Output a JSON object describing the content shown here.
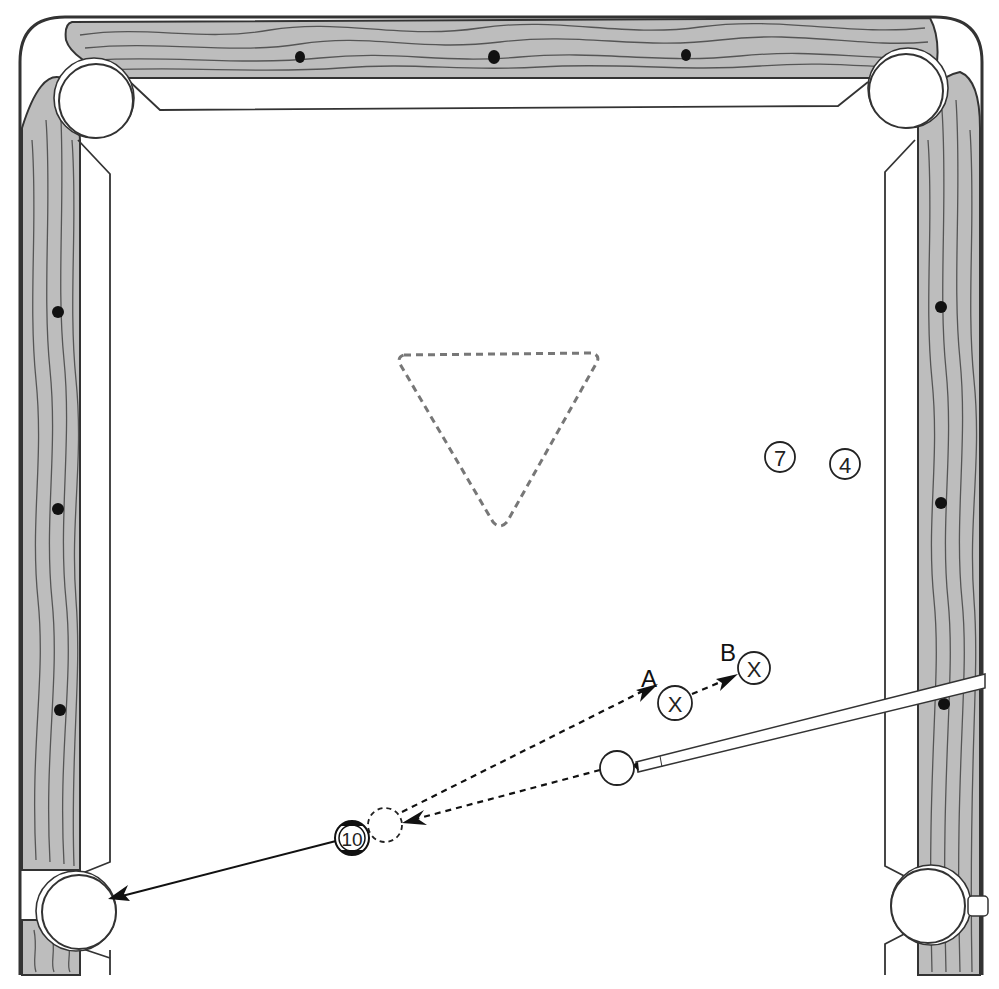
{
  "diagram": {
    "table": {
      "top_rail_diamonds": 3,
      "left_rail_diamonds": 3,
      "right_rail_diamonds": 3,
      "pockets": [
        "top-left",
        "top-right",
        "bottom-left",
        "bottom-right"
      ]
    },
    "rack_spot": "dashed triangle",
    "balls": [
      {
        "id": "7",
        "label": "7",
        "type": "object-ball"
      },
      {
        "id": "4",
        "label": "4",
        "type": "object-ball"
      },
      {
        "id": "10",
        "label": "10",
        "type": "striped-object-ball"
      },
      {
        "id": "cue",
        "label": "",
        "type": "cue-ball"
      },
      {
        "id": "ghost",
        "label": "",
        "type": "ghost-ball"
      },
      {
        "id": "A",
        "label": "X",
        "type": "target-position"
      },
      {
        "id": "B",
        "label": "X",
        "type": "target-position"
      }
    ],
    "position_labels": {
      "A": "A",
      "B": "B"
    },
    "paths": [
      {
        "from": "cue",
        "to": "ghost",
        "style": "dashed"
      },
      {
        "from": "ghost",
        "to": "A",
        "style": "dashed"
      },
      {
        "from": "A",
        "to": "B",
        "style": "dashed"
      },
      {
        "from": "10",
        "to": "bottom-left-pocket",
        "style": "solid"
      }
    ]
  }
}
